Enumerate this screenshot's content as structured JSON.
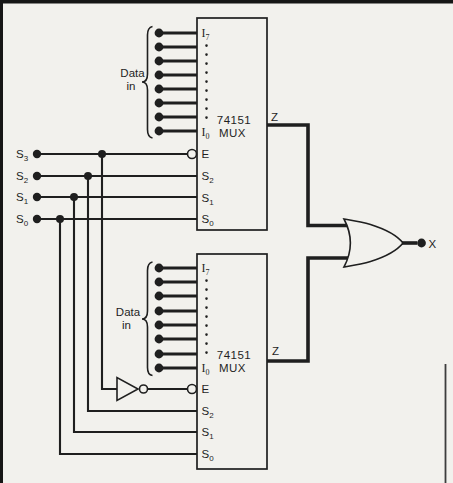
{
  "figure": {
    "background": "#f2f1ed",
    "ink": "#1f1f1f",
    "select_inputs": [
      {
        "base": "S",
        "sub": "3"
      },
      {
        "base": "S",
        "sub": "2"
      },
      {
        "base": "S",
        "sub": "1"
      },
      {
        "base": "S",
        "sub": "0"
      }
    ],
    "mux_top": {
      "chip": "74151",
      "device": "MUX",
      "data_in_line1": "Data",
      "data_in_line2": "in",
      "pins": {
        "i_top": {
          "base": "I",
          "sub": "7"
        },
        "i_bottom": {
          "base": "I",
          "sub": "0"
        },
        "enable": "E",
        "s2": {
          "base": "S",
          "sub": "2"
        },
        "s1": {
          "base": "S",
          "sub": "1"
        },
        "s0": {
          "base": "S",
          "sub": "0"
        }
      },
      "output": "Z"
    },
    "mux_bottom": {
      "chip": "74151",
      "device": "MUX",
      "data_in_line1": "Data",
      "data_in_line2": "in",
      "pins": {
        "i_top": {
          "base": "I",
          "sub": "7"
        },
        "i_bottom": {
          "base": "I",
          "sub": "0"
        },
        "enable": "E",
        "s2": {
          "base": "S",
          "sub": "2"
        },
        "s1": {
          "base": "S",
          "sub": "1"
        },
        "s0": {
          "base": "S",
          "sub": "0"
        }
      },
      "output": "Z"
    },
    "final_output": "X"
  }
}
